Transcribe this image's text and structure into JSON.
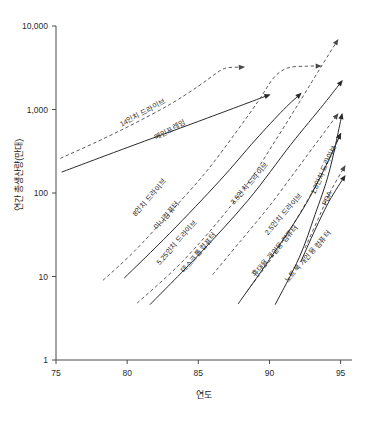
{
  "chart_data": {
    "type": "line",
    "title": "",
    "xlabel": "연도",
    "ylabel": "연간 총생산량(만대)",
    "xlim": [
      75,
      95.8
    ],
    "ylim": [
      1,
      10000
    ],
    "yscale": "log",
    "grid": false,
    "legend": "none",
    "x_ticks": [
      "75",
      "80",
      "85",
      "90",
      "95"
    ],
    "x_tick_values": [
      75,
      80,
      85,
      90,
      95
    ],
    "y_ticks": [
      "10,000",
      "1,000",
      "100",
      "10",
      "1"
    ],
    "y_tick_values": [
      10000,
      1000,
      100,
      10,
      1
    ],
    "series": [
      {
        "name": "14인치 드라이브",
        "style": "dashed",
        "label": "14인치 드라이브",
        "label_x": 79.6,
        "label_y": 620,
        "label_rotate": -28,
        "arrow": true,
        "points": [
          [
            75.3,
            260
          ],
          [
            78.0,
            420
          ],
          [
            80.5,
            680
          ],
          [
            83.0,
            1150
          ],
          [
            85.0,
            1900
          ],
          [
            86.3,
            2750
          ],
          [
            87.0,
            3150
          ],
          [
            88.2,
            3220
          ]
        ]
      },
      {
        "name": "메인프레임",
        "style": "solid",
        "label": "메인프레임",
        "label_x": 82.0,
        "label_y": 430,
        "label_rotate": -28,
        "arrow": true,
        "points": [
          [
            75.4,
            178
          ],
          [
            80.0,
            350
          ],
          [
            85.0,
            720
          ],
          [
            90.0,
            1500
          ]
        ]
      },
      {
        "name": "8인치 드라이브",
        "style": "dashed",
        "label": "8인치 드라이브",
        "label_x": 80.6,
        "label_y": 52,
        "label_rotate": -49,
        "arrow": true,
        "points": [
          [
            78.3,
            9.0
          ],
          [
            80.5,
            20
          ],
          [
            83.0,
            58
          ],
          [
            85.5,
            175
          ],
          [
            87.6,
            520
          ],
          [
            89.2,
            1250
          ],
          [
            90.3,
            2400
          ],
          [
            91.3,
            3150
          ],
          [
            92.6,
            3300
          ],
          [
            93.6,
            3320
          ]
        ]
      },
      {
        "name": "미니컴퓨터",
        "style": "solid",
        "label": "미니컴퓨터",
        "label_x": 82.1,
        "label_y": 36,
        "label_rotate": -49,
        "arrow": true,
        "points": [
          [
            79.8,
            9.6
          ],
          [
            83.0,
            33
          ],
          [
            86.5,
            140
          ],
          [
            89.0,
            430
          ],
          [
            91.0,
            1000
          ],
          [
            92.2,
            1550
          ]
        ]
      },
      {
        "name": "5.25인치 드라이브",
        "style": "dashed",
        "label": "5.25인치 드라이브",
        "label_x": 82.3,
        "label_y": 13.6,
        "label_rotate": -49,
        "arrow": true,
        "points": [
          [
            80.7,
            4.8
          ],
          [
            83.5,
            13
          ],
          [
            86.0,
            38
          ],
          [
            88.4,
            125
          ],
          [
            90.4,
            420
          ],
          [
            92.2,
            1300
          ],
          [
            93.7,
            3400
          ],
          [
            94.8,
            6800
          ]
        ]
      },
      {
        "name": "데스크톱 컴퓨터",
        "style": "solid",
        "label": "데스크톱 컴퓨터",
        "label_x": 84.0,
        "label_y": 11.0,
        "label_rotate": -49,
        "arrow": true,
        "points": [
          [
            81.6,
            4.6
          ],
          [
            85.0,
            18
          ],
          [
            88.5,
            82
          ],
          [
            91.5,
            380
          ],
          [
            93.8,
            1150
          ],
          [
            95.1,
            2200
          ]
        ]
      },
      {
        "name": "3.5인치 드라이브",
        "style": "dashed",
        "label": "3.5인치 드라이브",
        "label_x": 87.5,
        "label_y": 72,
        "label_rotate": -49,
        "arrow": true,
        "points": [
          [
            86.0,
            10.5
          ],
          [
            88.0,
            27
          ],
          [
            90.0,
            70
          ],
          [
            91.8,
            180
          ],
          [
            93.4,
            420
          ],
          [
            94.8,
            880
          ]
        ]
      },
      {
        "name": "2.5인치 드라이브",
        "style": "dashed",
        "label": "2.5인치 드라이브",
        "label_x": 89.9,
        "label_y": 31,
        "label_rotate": -49,
        "arrow": true,
        "points": [
          [
            88.4,
            6.6
          ],
          [
            90.2,
            17
          ],
          [
            92.0,
            52
          ],
          [
            93.6,
            160
          ],
          [
            95.0,
            510
          ]
        ]
      },
      {
        "name": "휴대용 개인용 컴퓨터",
        "style": "solid",
        "label": "휴대용 개인용 컴퓨터",
        "label_x": 89.0,
        "label_y": 9.8,
        "label_rotate": -49,
        "arrow": true,
        "points": [
          [
            87.8,
            4.7
          ],
          [
            90.0,
            16
          ],
          [
            92.3,
            62
          ],
          [
            93.8,
            185
          ],
          [
            95.0,
            510
          ]
        ]
      },
      {
        "name": "노트북 개인용 컴퓨터",
        "style": "solid",
        "label": "노트북 개인용 컴퓨터",
        "label_x": 91.3,
        "label_y": 8.4,
        "label_rotate": -49,
        "arrow": true,
        "points": [
          [
            90.4,
            4.6
          ],
          [
            92.1,
            17
          ],
          [
            93.2,
            55
          ],
          [
            94.2,
            180
          ],
          [
            95.1,
            880
          ]
        ]
      },
      {
        "name": "1.8인치 드라이브",
        "style": "dashed",
        "label": "1.8인치 드라이브",
        "label_x": 93.2,
        "label_y": 95,
        "label_rotate": -66,
        "arrow": true,
        "points": [
          [
            92.5,
            22
          ],
          [
            93.4,
            48
          ],
          [
            94.3,
            105
          ],
          [
            95.3,
            210
          ]
        ]
      },
      {
        "name": "PDA",
        "style": "solid",
        "label": "PDA",
        "label_x": 94.0,
        "label_y": 70,
        "label_rotate": -66,
        "arrow": true,
        "points": [
          [
            92.2,
            15
          ],
          [
            93.2,
            36
          ],
          [
            94.2,
            80
          ],
          [
            95.3,
            160
          ]
        ]
      }
    ]
  }
}
